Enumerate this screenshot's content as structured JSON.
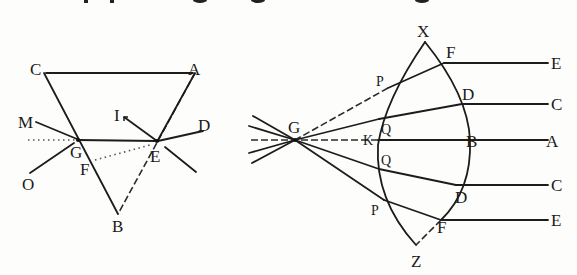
{
  "figure": {
    "header_fragment": "cut-off text line at top of page (illegible)",
    "prism": {
      "vertex_labels": {
        "top_left": "C",
        "top_right": "A",
        "bottom": "B"
      },
      "point_labels": {
        "left_incidence": "G",
        "right_incidence": "E",
        "inner": "F"
      },
      "ray_labels": {
        "incoming_upper": "M",
        "incoming_lower": "O",
        "outgoing_upper": "I",
        "outgoing_right": "D"
      }
    },
    "lens": {
      "apex_labels": {
        "top": "X",
        "bottom": "Z"
      },
      "focus_label": "G",
      "axis_labels": {
        "left_surface": "K",
        "right_surface": "B",
        "axis_end": "A"
      },
      "left_surface_labels": {
        "upper_outer": "P",
        "upper_inner": "Q",
        "lower_inner": "Q",
        "lower_outer": "P"
      },
      "right_surface_labels": {
        "upper_outer": "F",
        "upper_inner": "D",
        "lower_inner": "D",
        "lower_outer": "F"
      },
      "ray_end_labels": {
        "top": "E",
        "upper": "C",
        "axis": "A",
        "lower": "C",
        "bottom": "E"
      }
    }
  }
}
